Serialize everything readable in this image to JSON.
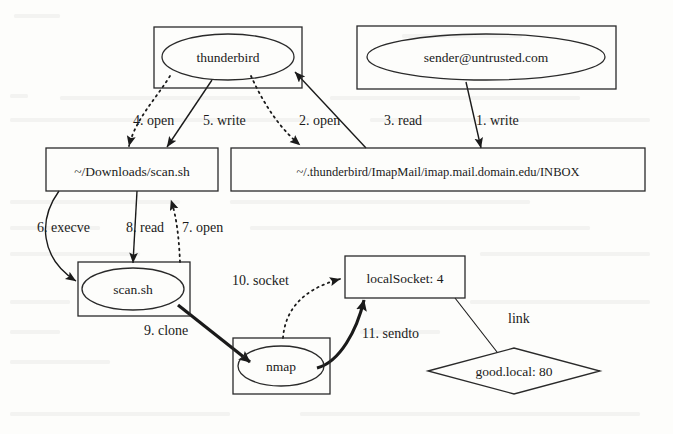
{
  "diagram": {
    "type": "provenance-graph",
    "nodes": [
      {
        "id": "thunderbird",
        "label": "thunderbird",
        "shape": "ellipse-in-box",
        "kind": "process"
      },
      {
        "id": "sender",
        "label": "sender@untrusted.com",
        "shape": "ellipse-in-box",
        "kind": "process"
      },
      {
        "id": "downloads",
        "label": "~/Downloads/scan.sh",
        "shape": "box",
        "kind": "file"
      },
      {
        "id": "inbox",
        "label": "~/.thunderbird/ImapMail/imap.mail.domain.edu/INBOX",
        "shape": "box",
        "kind": "file"
      },
      {
        "id": "scansh",
        "label": "scan.sh",
        "shape": "ellipse-in-box",
        "kind": "process"
      },
      {
        "id": "nmap",
        "label": "nmap",
        "shape": "ellipse-in-box",
        "kind": "process"
      },
      {
        "id": "localsocket",
        "label": "localSocket: 4",
        "shape": "box",
        "kind": "socket"
      },
      {
        "id": "goodlocal",
        "label": "good.local: 80",
        "shape": "diamond",
        "kind": "host"
      }
    ],
    "edges": [
      {
        "id": "e1",
        "label": "1. write",
        "from": "sender",
        "to": "inbox",
        "style": "solid"
      },
      {
        "id": "e2",
        "label": "2. open",
        "from": "thunderbird",
        "to": "inbox",
        "style": "dotted"
      },
      {
        "id": "e3",
        "label": "3. read",
        "from": "inbox",
        "to": "thunderbird",
        "style": "solid"
      },
      {
        "id": "e4",
        "label": "4. open",
        "from": "thunderbird",
        "to": "downloads",
        "style": "dotted"
      },
      {
        "id": "e5",
        "label": "5. write",
        "from": "thunderbird",
        "to": "downloads",
        "style": "solid"
      },
      {
        "id": "e6",
        "label": "6. execve",
        "from": "downloads",
        "to": "scansh",
        "style": "solid"
      },
      {
        "id": "e7",
        "label": "7. open",
        "from": "scansh",
        "to": "downloads",
        "style": "dotted"
      },
      {
        "id": "e8",
        "label": "8. read",
        "from": "downloads",
        "to": "scansh",
        "style": "solid"
      },
      {
        "id": "e9",
        "label": "9. clone",
        "from": "scansh",
        "to": "nmap",
        "style": "thick"
      },
      {
        "id": "e10",
        "label": "10. socket",
        "from": "nmap",
        "to": "localsocket",
        "style": "dotted"
      },
      {
        "id": "e11",
        "label": "11. sendto",
        "from": "nmap",
        "to": "localsocket",
        "style": "thick"
      },
      {
        "id": "e12",
        "label": "link",
        "from": "localsocket",
        "to": "goodlocal",
        "style": "plain"
      }
    ]
  },
  "colors": {
    "stroke": "#2a2a2a",
    "text": "#1a1a1a",
    "background": "#fdfdfb"
  }
}
